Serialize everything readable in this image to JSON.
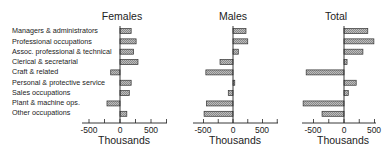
{
  "chart_data": {
    "type": "bar",
    "orientation": "horizontal",
    "categories": [
      "Managers & administrators",
      "Professional occupations",
      "Assoc. professional & technical",
      "Clerical & secretarial",
      "Craft & related",
      "Personal & protective service",
      "Sales occupations",
      "Plant & machine ops.",
      "Other occupations"
    ],
    "panels": [
      {
        "title": "Females",
        "xlabel": "Thousands",
        "xlim": [
          -700,
          800
        ],
        "ticks": [
          -500,
          0,
          500
        ],
        "values": [
          180,
          260,
          220,
          290,
          -150,
          180,
          150,
          -210,
          110
        ]
      },
      {
        "title": "Males",
        "xlabel": "Thousands",
        "xlim": [
          -700,
          800
        ],
        "ticks": [
          -500,
          0,
          500
        ],
        "values": [
          220,
          250,
          90,
          -220,
          -460,
          30,
          -80,
          -450,
          -490
        ]
      },
      {
        "title": "Total",
        "xlabel": "Thousands",
        "xlim": [
          -700,
          600
        ],
        "ticks": [
          -500,
          0,
          500
        ],
        "values": [
          390,
          490,
          310,
          50,
          -620,
          200,
          70,
          -670,
          -360
        ]
      }
    ],
    "bar_style": "hatched gray with dark outline",
    "grid": false,
    "legend": null
  },
  "labels": {
    "c0": "Managers & administrators",
    "c1": "Professional occupations",
    "c2": "Assoc. professional & technical",
    "c3": "Clerical & secretarial",
    "c4": "Craft & related",
    "c5": "Personal & protective service",
    "c6": "Sales occupations",
    "c7": "Plant & machine ops.",
    "c8": "Other occupations"
  },
  "titles": {
    "females": "Females",
    "males": "Males",
    "total": "Total"
  },
  "axis": {
    "xlabel": "Thousands",
    "tick_neg": "-500",
    "tick_zero": "0",
    "tick_pos": "500"
  }
}
